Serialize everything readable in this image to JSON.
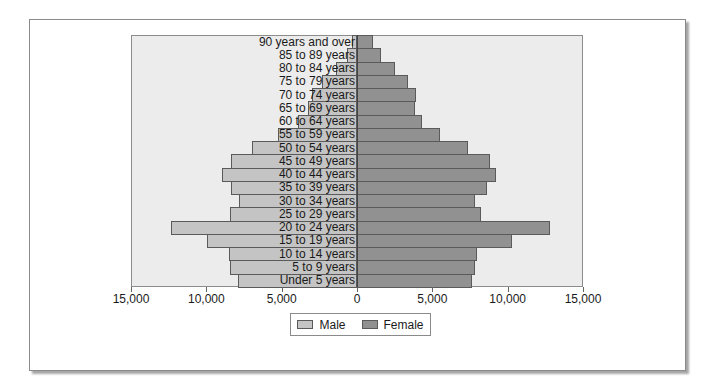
{
  "chart_data": {
    "type": "bar",
    "orientation": "horizontal",
    "subtype": "population-pyramid",
    "title": "",
    "xlabel": "",
    "ylabel": "",
    "xlim": [
      -15000,
      15000
    ],
    "x_ticks": [
      -15000,
      -10000,
      -5000,
      0,
      5000,
      10000,
      15000
    ],
    "x_tick_labels": [
      "15,000",
      "10,000",
      "5,000",
      "0",
      "5,000",
      "10,000",
      "15,000"
    ],
    "grid": false,
    "legend_position": "bottom",
    "categories": [
      "90 years and over",
      "85 to 89 years",
      "80 to 84 years",
      "75 to 79 years",
      "70 to 74 years",
      "65 to 69 years",
      "60 to 64 years",
      "55 to 59 years",
      "50 to 54 years",
      "45 to 49 years",
      "40 to 44 years",
      "35 to 39 years",
      "30 to 34 years",
      "25 to 29 years",
      "20 to 24 years",
      "15 to 19 years",
      "10 to 14 years",
      "5 to 9 years",
      "Under 5 years"
    ],
    "series": [
      {
        "name": "Male",
        "color": "#c4c4c4",
        "side": "left",
        "values": [
          350,
          650,
          1400,
          2300,
          3000,
          3250,
          3900,
          5250,
          6950,
          8350,
          8950,
          8350,
          7800,
          8400,
          12350,
          9950,
          8500,
          8400,
          7900
        ]
      },
      {
        "name": "Female",
        "color": "#919191",
        "side": "right",
        "values": [
          1050,
          1600,
          2550,
          3400,
          3900,
          3850,
          4300,
          5500,
          7400,
          8850,
          9200,
          8600,
          7800,
          8250,
          12800,
          10300,
          7950,
          7800,
          7600
        ]
      }
    ]
  },
  "legend": {
    "items": [
      {
        "label": "Male",
        "color": "#c4c4c4"
      },
      {
        "label": "Female",
        "color": "#919191"
      }
    ]
  },
  "colors": {
    "plot_background": "#ececec",
    "bar_border": "#5a5a5a",
    "male": "#c4c4c4",
    "female": "#919191"
  }
}
